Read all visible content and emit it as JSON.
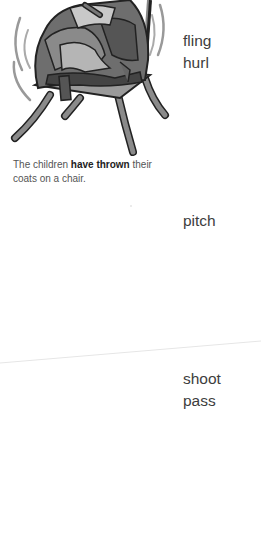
{
  "illustration": {
    "subject": "pile of coats on a chair",
    "icon": "chair-with-coats-illustration"
  },
  "group1": {
    "synonyms": [
      "fling",
      "hurl"
    ]
  },
  "caption": {
    "before": "The children ",
    "emphasis": "have thrown",
    "after": " their coats on a chair."
  },
  "group2": {
    "synonyms": [
      "pitch"
    ]
  },
  "group3": {
    "synonyms": [
      "shoot",
      "pass"
    ]
  },
  "colors": {
    "text": "#3d3d3d",
    "caption": "#555555",
    "divider": "#e6e6e6"
  }
}
